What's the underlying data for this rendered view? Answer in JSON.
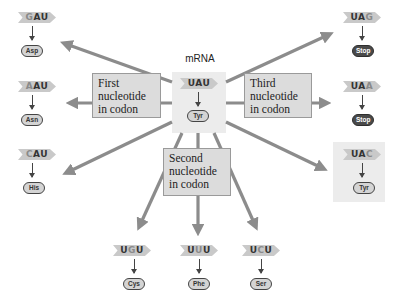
{
  "center": {
    "label": "mRNA",
    "codon": [
      "U",
      "A",
      "U"
    ],
    "variable_index": -1,
    "amino_acid": "Tyr"
  },
  "label_boxes": {
    "first": [
      "First",
      "nucleotide",
      "in codon"
    ],
    "second": [
      "Second",
      "nucleotide",
      "in codon"
    ],
    "third": [
      "Third",
      "nucleotide",
      "in codon"
    ]
  },
  "left_column": [
    {
      "codon": [
        "G",
        "A",
        "U"
      ],
      "variable_index": 0,
      "amino_acid": "Asp",
      "stop": false
    },
    {
      "codon": [
        "A",
        "A",
        "U"
      ],
      "variable_index": 0,
      "amino_acid": "Asn",
      "stop": false
    },
    {
      "codon": [
        "C",
        "A",
        "U"
      ],
      "variable_index": 0,
      "amino_acid": "His",
      "stop": false
    }
  ],
  "right_column": [
    {
      "codon": [
        "U",
        "A",
        "G"
      ],
      "variable_index": 2,
      "amino_acid": "Stop",
      "stop": true
    },
    {
      "codon": [
        "U",
        "A",
        "A"
      ],
      "variable_index": 2,
      "amino_acid": "Stop",
      "stop": true
    },
    {
      "codon": [
        "U",
        "A",
        "C"
      ],
      "variable_index": 2,
      "amino_acid": "Tyr",
      "stop": false,
      "highlighted": true
    }
  ],
  "bottom_row": [
    {
      "codon": [
        "U",
        "G",
        "U"
      ],
      "variable_index": 1,
      "amino_acid": "Cys",
      "stop": false
    },
    {
      "codon": [
        "U",
        "U",
        "U"
      ],
      "variable_index": 1,
      "amino_acid": "Phe",
      "stop": false
    },
    {
      "codon": [
        "U",
        "C",
        "U"
      ],
      "variable_index": 1,
      "amino_acid": "Ser",
      "stop": false
    }
  ],
  "colors": {
    "arrow": "#8c8c8c",
    "box_fill": "#dcdcdc",
    "tag_fill": "#c9c9c9",
    "stop_pill": "#4a4a4a",
    "aa_pill": "#d4d4d4"
  }
}
